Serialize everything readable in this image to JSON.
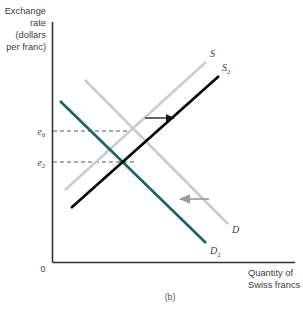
{
  "figure": {
    "caption": "(b)",
    "background": "#ffffff"
  },
  "axes": {
    "y_label_lines": [
      "Exchange",
      "rate",
      "(dollars",
      "per franc)"
    ],
    "x_label_lines": [
      "Quantity of",
      "Swiss francs"
    ],
    "origin_label": "0",
    "axis_color": "#333333"
  },
  "ticks": {
    "y": [
      {
        "label": "e",
        "sub": "0",
        "value_y": 131
      },
      {
        "label": "e",
        "sub": "2",
        "value_y": 162
      }
    ]
  },
  "colors": {
    "original_curve": "#c9cdcd",
    "new_demand": "#17636e",
    "new_supply": "#000000",
    "dash": "#555555",
    "arrow_supply": "#111111",
    "arrow_demand": "#9a9a9a",
    "text": "#3c3c3c"
  },
  "curves": [
    {
      "name": "supply-original",
      "label": "S",
      "sub": "",
      "color": "#c9cdcd",
      "x1": 65,
      "y1": 190,
      "x2": 206,
      "y2": 62,
      "label_x": 210,
      "label_y": 57
    },
    {
      "name": "supply-new",
      "label": "S",
      "sub": "2",
      "color": "#000000",
      "x1": 71,
      "y1": 208,
      "x2": 219,
      "y2": 76,
      "label_x": 222,
      "label_y": 71
    },
    {
      "name": "demand-original",
      "label": "D",
      "sub": "",
      "color": "#c9cdcd",
      "x1": 85,
      "y1": 80,
      "x2": 228,
      "y2": 224,
      "label_x": 232,
      "label_y": 233
    },
    {
      "name": "demand-new",
      "label": "D",
      "sub": "2",
      "color": "#17636e",
      "x1": 60,
      "y1": 101,
      "x2": 206,
      "y2": 243,
      "label_x": 210,
      "label_y": 254
    }
  ],
  "arrows": [
    {
      "name": "supply-shift-arrow",
      "direction": "right",
      "color": "#111111",
      "x1": 145,
      "y1": 118,
      "x2": 174,
      "y2": 118
    },
    {
      "name": "demand-shift-arrow",
      "direction": "left",
      "color": "#9a9a9a",
      "x1": 209,
      "y1": 199,
      "x2": 180,
      "y2": 199
    }
  ],
  "dashed_lines": [
    {
      "name": "e0-dash",
      "x1": 53,
      "y1": 131,
      "x2": 131,
      "y2": 131
    },
    {
      "name": "e2-dash",
      "x1": 53,
      "y1": 162,
      "x2": 137,
      "y2": 162
    }
  ],
  "plot_area": {
    "x_axis_y": 262,
    "y_axis_x": 52,
    "y_axis_top": 22,
    "x_axis_right": 295
  }
}
